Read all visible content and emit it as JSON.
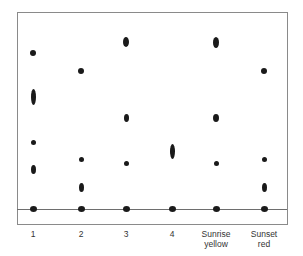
{
  "figure": {
    "title": "",
    "spot_color": "#1a1a1a",
    "frame_color": "#8a8a8a",
    "baseline_color": "#6e6e6e",
    "text_color": "#333333"
  },
  "lanes": [
    {
      "id": "1",
      "label_line1": "1",
      "label_line2": "",
      "x": 33,
      "spots": [
        {
          "y": 53,
          "w": 6,
          "h": 6
        },
        {
          "y": 97,
          "w": 5,
          "h": 16
        },
        {
          "y": 142,
          "w": 5,
          "h": 5
        },
        {
          "y": 169,
          "w": 5,
          "h": 9
        },
        {
          "y": 209,
          "w": 7,
          "h": 6
        }
      ]
    },
    {
      "id": "2",
      "label_line1": "2",
      "label_line2": "",
      "x": 81,
      "spots": [
        {
          "y": 71,
          "w": 6,
          "h": 6
        },
        {
          "y": 159,
          "w": 5,
          "h": 5
        },
        {
          "y": 187,
          "w": 5,
          "h": 9
        },
        {
          "y": 209,
          "w": 7,
          "h": 6
        }
      ]
    },
    {
      "id": "3",
      "label_line1": "3",
      "label_line2": "",
      "x": 126,
      "spots": [
        {
          "y": 42,
          "w": 6,
          "h": 10
        },
        {
          "y": 118,
          "w": 5,
          "h": 8
        },
        {
          "y": 163,
          "w": 5,
          "h": 5
        },
        {
          "y": 209,
          "w": 7,
          "h": 6
        }
      ]
    },
    {
      "id": "4",
      "label_line1": "4",
      "label_line2": "",
      "x": 172,
      "spots": [
        {
          "y": 151,
          "w": 5,
          "h": 15
        },
        {
          "y": 209,
          "w": 7,
          "h": 6
        }
      ]
    },
    {
      "id": "sunrise-yellow",
      "label_line1": "Sunrise",
      "label_line2": "yellow",
      "x": 216,
      "spots": [
        {
          "y": 42,
          "w": 6,
          "h": 11
        },
        {
          "y": 118,
          "w": 6,
          "h": 8
        },
        {
          "y": 163,
          "w": 5,
          "h": 5
        },
        {
          "y": 209,
          "w": 7,
          "h": 6
        }
      ]
    },
    {
      "id": "sunset-red",
      "label_line1": "Sunset",
      "label_line2": "red",
      "x": 264,
      "spots": [
        {
          "y": 71,
          "w": 6,
          "h": 6
        },
        {
          "y": 159,
          "w": 5,
          "h": 5
        },
        {
          "y": 187,
          "w": 5,
          "h": 9
        },
        {
          "y": 209,
          "w": 7,
          "h": 6
        }
      ]
    }
  ]
}
